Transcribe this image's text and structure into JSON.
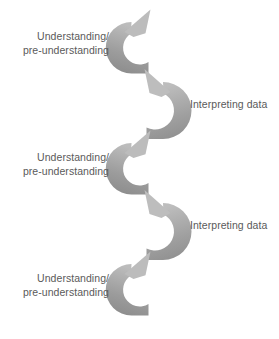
{
  "diagram": {
    "type": "cyclical-spiral",
    "colors": {
      "text": "#5a5a5a",
      "arrow_tail": "#8a8a8a",
      "arrow_head": "#b5b5b5",
      "arrow_mid": "#9e9e9e",
      "background": "#ffffff"
    },
    "labels": [
      {
        "id": "understanding-1",
        "text": "Understanding/\npre-understanding",
        "side": "left",
        "step": 1
      },
      {
        "id": "interpreting-1",
        "text": "Interpreting data",
        "side": "right",
        "step": 2
      },
      {
        "id": "understanding-2",
        "text": "Understanding/\npre-understanding",
        "side": "left",
        "step": 3
      },
      {
        "id": "interpreting-2",
        "text": "Interpreting data",
        "side": "right",
        "step": 4
      },
      {
        "id": "understanding-3",
        "text": "Understanding/\npre-understanding",
        "side": "left",
        "step": 5
      }
    ],
    "arrows": [
      {
        "id": "arrow-1",
        "opens": "right",
        "head": "top",
        "direction": "counter-clockwise-upward",
        "label_ref": "understanding-1"
      },
      {
        "id": "arrow-2",
        "opens": "left",
        "head": "top",
        "direction": "clockwise-upward",
        "label_ref": "interpreting-1"
      },
      {
        "id": "arrow-3",
        "opens": "right",
        "head": "top",
        "direction": "counter-clockwise-upward",
        "label_ref": "understanding-2"
      },
      {
        "id": "arrow-4",
        "opens": "left",
        "head": "top",
        "direction": "clockwise-upward",
        "label_ref": "interpreting-2"
      },
      {
        "id": "arrow-5",
        "opens": "right",
        "head": "top",
        "direction": "counter-clockwise-upward",
        "label_ref": "understanding-3"
      }
    ]
  }
}
